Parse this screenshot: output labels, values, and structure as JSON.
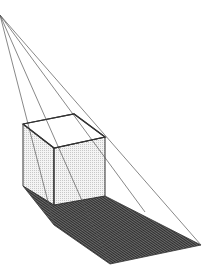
{
  "diagram": {
    "type": "perspective-shadow-construction",
    "colors": {
      "background": "#ffffff",
      "line": "#3a3a3a",
      "cube_face": "#f2f2f2",
      "cube_dots": "#c8c8c8",
      "shadow": "#555555",
      "shadow_hatch": "#2a2a2a"
    },
    "light_source": [
      0,
      15
    ],
    "cube": {
      "top": [
        [
          23,
          124
        ],
        [
          74,
          114
        ],
        [
          105,
          137
        ],
        [
          54,
          148
        ]
      ],
      "left_face": [
        [
          23,
          124
        ],
        [
          54,
          148
        ],
        [
          54,
          205
        ],
        [
          23,
          186
        ]
      ],
      "front_face": [
        [
          54,
          148
        ],
        [
          105,
          137
        ],
        [
          105,
          196
        ],
        [
          54,
          205
        ]
      ]
    },
    "shadow": [
      [
        23,
        186
      ],
      [
        54,
        205
      ],
      [
        105,
        196
      ],
      [
        201,
        245
      ],
      [
        110,
        264
      ],
      [
        54,
        225
      ]
    ],
    "rays": [
      [
        [
          0,
          15
        ],
        [
          54,
          225
        ]
      ],
      [
        [
          0,
          15
        ],
        [
          110,
          264
        ]
      ],
      [
        [
          0,
          15
        ],
        [
          201,
          245
        ]
      ],
      [
        [
          0,
          15
        ],
        [
          145,
          212
        ]
      ]
    ]
  }
}
